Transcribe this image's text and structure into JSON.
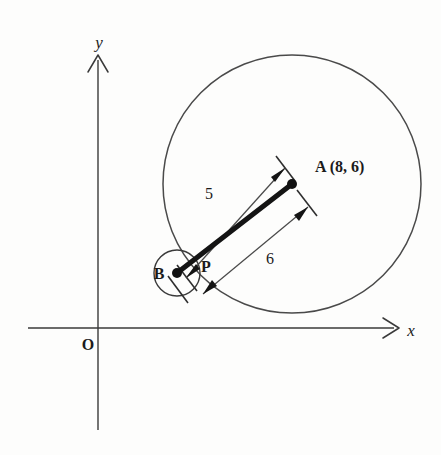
{
  "figure": {
    "kind": "geometry-diagram",
    "background_color": "#fdfdfc",
    "ink_color": "#1b1b1b"
  },
  "axes": {
    "x_label": "x",
    "y_label": "y",
    "origin_label": "O",
    "x_axis_start_px": [
      28,
      328
    ],
    "x_axis_end_px": [
      399,
      328
    ],
    "y_axis_start_px": [
      98,
      430
    ],
    "y_axis_end_px": [
      98,
      55
    ],
    "arrow_style": "open-v"
  },
  "points": [
    {
      "id": "A",
      "label": "A (8, 6)",
      "short_label": "A",
      "coordinates": [
        8,
        6
      ],
      "px": [
        292,
        184
      ],
      "dot": true
    },
    {
      "id": "B",
      "label": "B",
      "px": [
        177,
        273
      ],
      "dot": true
    },
    {
      "id": "P",
      "label": "P",
      "px": [
        193,
        261
      ],
      "dot": false
    }
  ],
  "circles": [
    {
      "id": "big-circle",
      "center_point": "A",
      "center_px": [
        292,
        184
      ],
      "radius_px": 129,
      "stroke": "#4a4a4a"
    },
    {
      "id": "small-circle",
      "center_point": "B",
      "center_px": [
        177,
        273
      ],
      "radius_px": 23,
      "stroke": "#3a3a3a"
    }
  ],
  "segments": [
    {
      "id": "chord-BA",
      "from": "B",
      "to": "A",
      "style": "thick",
      "stroke": "#141414"
    }
  ],
  "dimensions": [
    {
      "id": "dim-5",
      "label": "5",
      "value": 5,
      "from": "P",
      "to": "A",
      "label_px": [
        209,
        194
      ],
      "side": "upper-left",
      "offset_px": 24,
      "arrows": "both"
    },
    {
      "id": "dim-6",
      "label": "6",
      "value": 6,
      "from": "B",
      "to": "A",
      "label_px": [
        270,
        258
      ],
      "side": "lower-right",
      "offset_px": 30,
      "arrows": "both"
    }
  ],
  "annotations": {
    "a_coord_text": "A (8, 6)",
    "dim_5_text": "5",
    "dim_6_text": "6",
    "point_b_text": "B",
    "point_p_text": "P",
    "origin_text": "O",
    "x_axis_text": "x",
    "y_axis_text": "y"
  }
}
